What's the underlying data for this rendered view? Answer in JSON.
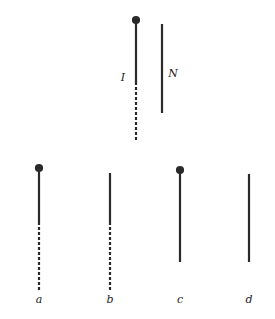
{
  "diagram": {
    "type": "chromosome-segment-schematic",
    "top_pair": {
      "left": {
        "label": "I",
        "has_centromere_dot": true,
        "solid": [
          20,
          82
        ],
        "dashed": [
          82,
          142
        ]
      },
      "right": {
        "label": "N",
        "has_centromere_dot": false,
        "solid": [
          24,
          113
        ],
        "dashed": null
      }
    },
    "bottom_row": [
      {
        "label": "a",
        "has_centromere_dot": true,
        "solid": [
          168,
          222
        ],
        "dashed": [
          222,
          290
        ]
      },
      {
        "label": "b",
        "has_centromere_dot": false,
        "solid": [
          173,
          222
        ],
        "dashed": [
          222,
          290
        ]
      },
      {
        "label": "c",
        "has_centromere_dot": true,
        "solid": [
          170,
          262
        ],
        "dashed": null
      },
      {
        "label": "d",
        "has_centromere_dot": false,
        "solid": [
          174,
          262
        ],
        "dashed": null
      }
    ],
    "colors": {
      "line": "#2a2a2a",
      "background": "#ffffff"
    }
  }
}
